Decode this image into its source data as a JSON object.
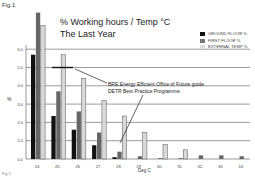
{
  "figure_label": "Fig.1",
  "footer_label": "Fig.2",
  "chart_data": {
    "type": "bar",
    "title": "% Working hours / Temp °C",
    "subtitle": "The Last Year",
    "xlabel": "Deg C",
    "ylabel": "%",
    "categories": [
      "24",
      "25",
      "26",
      "27",
      "28",
      "29",
      "30",
      "31",
      "32",
      "33",
      "34"
    ],
    "series": [
      {
        "name": "GROUND FLOOR %",
        "color": "#111111",
        "values": [
          5.7,
          2.35,
          1.6,
          0.75,
          0.1,
          0.0,
          0.0,
          0.0,
          0.0,
          0.0,
          0.0
        ]
      },
      {
        "name": "FIRST FLOOR %",
        "color": "#666666",
        "values": [
          8.0,
          3.7,
          2.6,
          1.45,
          0.4,
          0.15,
          0.05,
          0.05,
          0.2,
          0.2,
          0.15
        ]
      },
      {
        "name": "EXTERNAL TEMP %",
        "color": "#d8d8d8",
        "values": [
          7.3,
          5.7,
          4.4,
          3.2,
          2.35,
          1.45,
          0.8,
          0.5,
          0.0,
          0.0,
          0.0
        ]
      }
    ],
    "yticks": [
      "0.0",
      "1.0",
      "2.0",
      "3.0",
      "4.0",
      "5.0",
      "6.0"
    ],
    "ylim": [
      0,
      6
    ],
    "grid": true,
    "legend_position": "top-right",
    "reference_line": {
      "value": 5.0,
      "label_line1": "BRE Energy Efficient Office of Future guide",
      "label_line2": "DETR Best Practice Programme"
    }
  }
}
